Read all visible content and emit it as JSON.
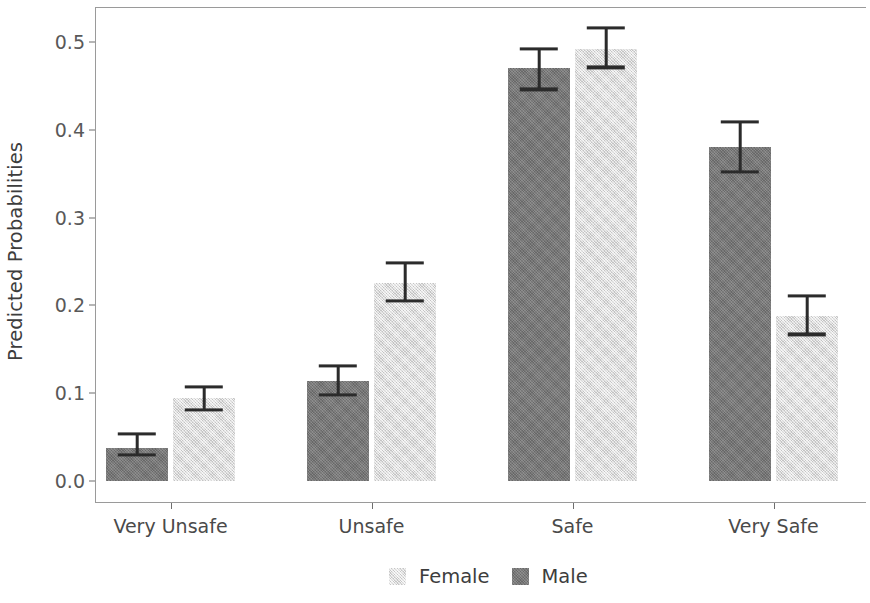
{
  "chart_data": {
    "type": "bar",
    "title": "",
    "subtitle": "",
    "xlabel": "",
    "ylabel": "Predicted Probabilities",
    "categories": [
      "Very Unsafe",
      "Unsafe",
      "Safe",
      "Very Safe"
    ],
    "series": [
      {
        "name": "Male",
        "color": "#767676",
        "values": [
          0.038,
          0.114,
          0.47,
          0.38
        ],
        "error_low": [
          0.03,
          0.098,
          0.446,
          0.352
        ],
        "error_high": [
          0.054,
          0.131,
          0.492,
          0.409
        ]
      },
      {
        "name": "Female",
        "color": "#dedede",
        "values": [
          0.094,
          0.226,
          0.492,
          0.188
        ],
        "error_low": [
          0.081,
          0.205,
          0.471,
          0.167
        ],
        "error_high": [
          0.107,
          0.248,
          0.516,
          0.211
        ]
      }
    ],
    "group_order": [
      "Male",
      "Female"
    ],
    "ylim": [
      0.0,
      0.545
    ],
    "yticks": [
      0.0,
      0.1,
      0.2,
      0.3,
      0.4,
      0.5
    ],
    "ytick_labels": [
      "0.0",
      "0.1",
      "0.2",
      "0.3",
      "0.4",
      "0.5"
    ],
    "grid": false,
    "legend_position": "bottom",
    "legend_entries": [
      {
        "label": "Female",
        "swatch": "female"
      },
      {
        "label": "Male",
        "swatch": "male"
      }
    ],
    "errorbar_color": "#2b2b2b",
    "panel_border_color": "#9a9a9a",
    "background": "#ffffff"
  }
}
